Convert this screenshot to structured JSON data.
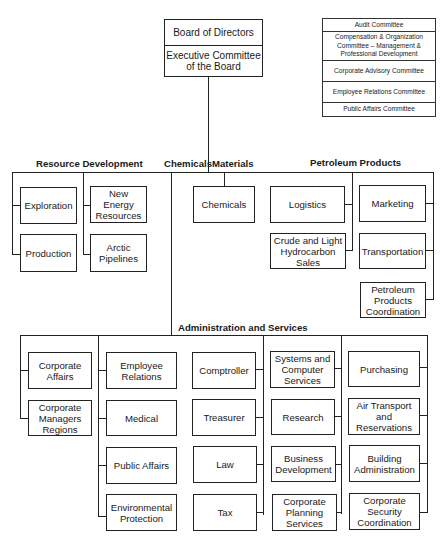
{
  "board": {
    "title": "Board of Directors",
    "executive": "Executive Committee of the Board"
  },
  "committees": [
    "Audit Committee",
    "Compensation & Organization Committee – Management & Professional Development",
    "Corporate Advisory Committee",
    "Employee Relations Committee",
    "Public Affairs Committee"
  ],
  "groups": {
    "resource_development": {
      "label": "Resource Development",
      "units": [
        "Exploration",
        "Production",
        "New Energy Resources",
        "Arctic Pipelines"
      ]
    },
    "chemicals": {
      "label": "Chemicals"
    },
    "materials": {
      "label": "Materials",
      "units": [
        "Chemicals"
      ]
    },
    "petroleum_products": {
      "label": "Petroleum Products",
      "units": [
        "Logistics",
        "Crude and Light Hydrocarbon Sales",
        "Marketing",
        "Transportation",
        "Petroleum Products Coordination"
      ]
    },
    "administration": {
      "label": "Administration and Services",
      "col1": [
        "Corporate Affairs",
        "Corporate Managers Regions"
      ],
      "col2": [
        "Employee Relations",
        "Medical",
        "Public Affairs",
        "Environmental Protection"
      ],
      "col3": [
        "Comptroller",
        "Treasurer",
        "Law",
        "Tax"
      ],
      "col4": [
        "Systems and Computer Services",
        "Research",
        "Business Development",
        "Corporate Planning Services"
      ],
      "col5": [
        "Purchasing",
        "Air Transport and Reservations",
        "Building Administration",
        "Corporate Security Coordination"
      ]
    }
  }
}
